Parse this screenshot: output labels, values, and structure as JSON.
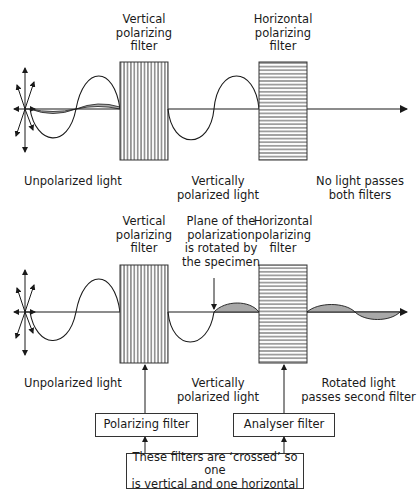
{
  "top_panel": {
    "filter1_label": [
      "Vertical",
      "polarizing",
      "filter"
    ],
    "filter2_label": [
      "Horizontal",
      "polarizing",
      "filter"
    ],
    "caption_unpolarized": "Unpolarized light",
    "caption_vertical": [
      "Vertically",
      "polarized light"
    ],
    "caption_result": [
      "No light passes",
      "both filters"
    ]
  },
  "bottom_panel": {
    "filter1_label": [
      "Vertical",
      "polarizing",
      "filter"
    ],
    "specimen_label": [
      "Plane of the",
      "polarization",
      "is rotated by",
      "the specimen"
    ],
    "filter2_label": [
      "Horizontal",
      "polarizing",
      "filter"
    ],
    "caption_unpolarized": "Unpolarized light",
    "caption_vertical": [
      "Vertically",
      "polarized light"
    ],
    "caption_result": [
      "Rotated light",
      "passes second filter"
    ]
  },
  "boxes": {
    "polarizing_filter": "Polarizing filter",
    "analyser_filter": "Analyser filter",
    "note": [
      "These filters are ‘crossed’ so one",
      "is vertical and one horizontal"
    ]
  },
  "colors": {
    "line": "#1a1a1a",
    "shade": "#a8a8a8"
  }
}
